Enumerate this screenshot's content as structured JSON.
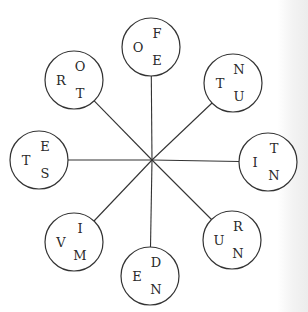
{
  "diagram": {
    "type": "letter-wheel",
    "hub": {
      "x": 152,
      "y": 160
    },
    "node_radius": 29,
    "nodes": [
      {
        "id": "top",
        "cx": 151,
        "cy": 47,
        "letters": {
          "top_right": "F",
          "left": "O",
          "bottom_right": "E"
        }
      },
      {
        "id": "top-right",
        "cx": 233,
        "cy": 83,
        "letters": {
          "top_right": "N",
          "left": "T",
          "bottom_right": "U"
        }
      },
      {
        "id": "right",
        "cx": 268,
        "cy": 162,
        "letters": {
          "top_right": "T",
          "left": "I",
          "bottom_right": "N"
        }
      },
      {
        "id": "bottom-right",
        "cx": 232,
        "cy": 240,
        "letters": {
          "top_right": "R",
          "left": "U",
          "bottom_right": "N"
        }
      },
      {
        "id": "bottom",
        "cx": 150,
        "cy": 276,
        "letters": {
          "top_right": "D",
          "left": "E",
          "bottom_right": "N"
        }
      },
      {
        "id": "bottom-left",
        "cx": 74,
        "cy": 242,
        "letters": {
          "top_right": "I",
          "left": "V",
          "bottom_right": "M"
        }
      },
      {
        "id": "left",
        "cx": 39,
        "cy": 160,
        "letters": {
          "top_right": "E",
          "left": "T",
          "bottom_right": "S"
        }
      },
      {
        "id": "top-left",
        "cx": 74,
        "cy": 80,
        "letters": {
          "top_right": "O",
          "left": "R",
          "bottom_right": "T"
        }
      }
    ]
  }
}
